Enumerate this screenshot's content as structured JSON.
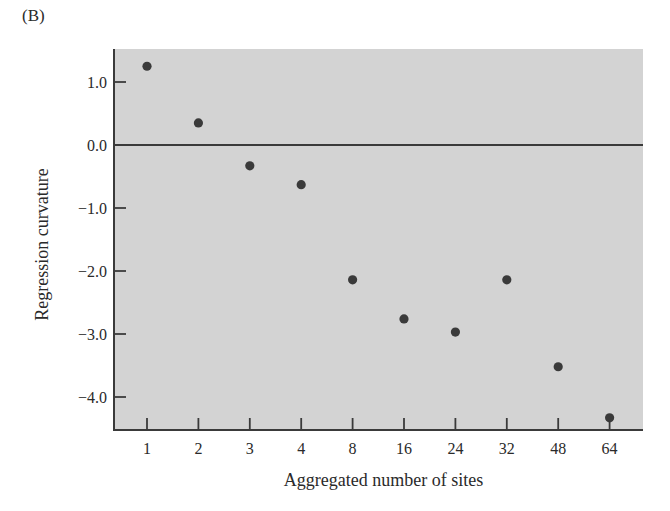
{
  "panel_label": "(B)",
  "chart_data": {
    "type": "scatter",
    "title": "",
    "xlabel": "Aggregated number of sites",
    "ylabel": "Regression curvature",
    "categories": [
      "1",
      "2",
      "3",
      "4",
      "8",
      "16",
      "24",
      "32",
      "48",
      "64"
    ],
    "values": [
      1.25,
      0.35,
      -0.33,
      -0.63,
      -2.14,
      -2.76,
      -2.97,
      -2.14,
      -3.52,
      -4.33
    ],
    "yticks": [
      "1.0",
      "0.0",
      "-1.0",
      "-2.0",
      "-3.0",
      "-4.0"
    ],
    "ytick_values": [
      1.0,
      0.0,
      -1.0,
      -2.0,
      -3.0,
      -4.0
    ],
    "ylim": [
      -4.5,
      1.5
    ],
    "reference_line": 0.0,
    "grid": false,
    "legend": null,
    "colors": {
      "background": "#d3d3d3",
      "points": "#3a3a3a",
      "axes": "#3a3a3a"
    }
  }
}
